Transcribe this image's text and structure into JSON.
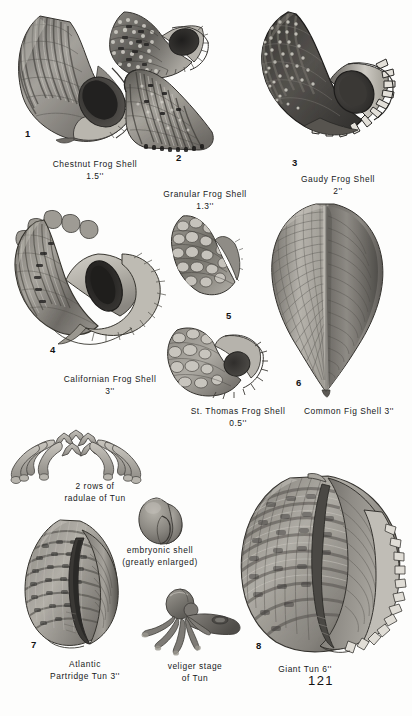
{
  "page": {
    "number": "121",
    "background_color": "#fdfdfc",
    "text_color": "#16181a"
  },
  "figures": [
    {
      "id": "1",
      "marker": "1",
      "name": "Chestnut Frog Shell",
      "size": "1.5''",
      "caption_lines": [
        "Chestnut Frog Shell",
        "1.5''"
      ],
      "icon": "chestnut-frog-shell"
    },
    {
      "id": "2",
      "marker": "2",
      "name": "Granular Frog Shell",
      "size": "1.3''",
      "caption_lines": [
        "Granular Frog Shell",
        "1.3''"
      ],
      "icon": "granular-frog-shell"
    },
    {
      "id": "3",
      "marker": "3",
      "name": "Gaudy Frog Shell",
      "size": "2''",
      "caption_lines": [
        "Gaudy Frog Shell",
        "2''"
      ],
      "icon": "gaudy-frog-shell"
    },
    {
      "id": "4",
      "marker": "4",
      "name": "Californian Frog Shell",
      "size": "3''",
      "caption_lines": [
        "Californian Frog Shell",
        "3''"
      ],
      "icon": "californian-frog-shell"
    },
    {
      "id": "5",
      "marker": "5",
      "name": "St. Thomas Frog Shell",
      "size": "0.5''",
      "caption_lines": [
        "St. Thomas Frog Shell",
        "0.5''"
      ],
      "icon": "st-thomas-frog-shell"
    },
    {
      "id": "6",
      "marker": "6",
      "name": "Common Fig Shell",
      "size": "3''",
      "caption_lines": [
        "Common Fig Shell 3''"
      ],
      "icon": "common-fig-shell"
    },
    {
      "id": "7",
      "marker": "7",
      "name": "Atlantic Partridge Tun",
      "size": "3''",
      "caption_lines": [
        "Atlantic",
        "Partridge Tun 3''"
      ],
      "icon": "atlantic-partridge-tun"
    },
    {
      "id": "8",
      "marker": "8",
      "name": "Giant Tun",
      "size": "6''",
      "caption_lines": [
        "Giant Tun 6''"
      ],
      "icon": "giant-tun"
    }
  ],
  "diagrams": [
    {
      "id": "radulae",
      "caption_lines": [
        "2 rows of",
        "radulae of Tun"
      ],
      "icon": "radulae-diagram"
    },
    {
      "id": "embryonic",
      "caption_lines": [
        "embryonic shell",
        "(greatly enlarged)"
      ],
      "icon": "embryonic-shell"
    },
    {
      "id": "veliger",
      "caption_lines": [
        "veliger stage",
        "of Tun"
      ],
      "icon": "veliger-larva"
    }
  ],
  "captions": {
    "fig1_line1": "Chestnut Frog Shell",
    "fig1_line2": "1.5''",
    "fig2_line1": "Granular Frog Shell",
    "fig2_line2": "1.3''",
    "fig3_line1": "Gaudy Frog Shell",
    "fig3_line2": "2''",
    "fig4_line1": "Californian Frog Shell",
    "fig4_line2": "3''",
    "fig5_line1": "St. Thomas Frog Shell",
    "fig5_line2": "0.5''",
    "fig6_line1": "Common Fig Shell 3''",
    "fig7_line1": "Atlantic",
    "fig7_line2": "Partridge Tun 3''",
    "fig8_line1": "Giant Tun 6''",
    "radulae_line1": "2 rows of",
    "radulae_line2": "radulae of Tun",
    "embryonic_line1": "embryonic shell",
    "embryonic_line2": "(greatly enlarged)",
    "veliger_line1": "veliger stage",
    "veliger_line2": "of Tun"
  },
  "markers": {
    "m1": "1",
    "m2": "2",
    "m3": "3",
    "m4": "4",
    "m5": "5",
    "m6": "6",
    "m7": "7",
    "m8": "8"
  }
}
